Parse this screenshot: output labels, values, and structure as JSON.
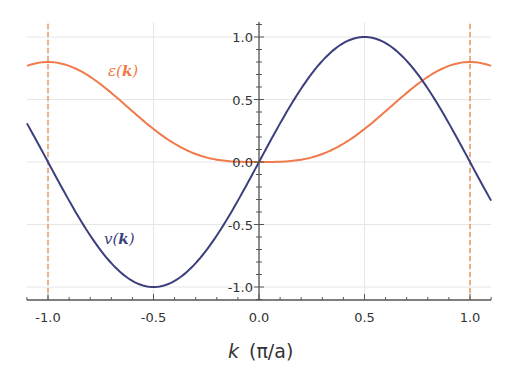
{
  "chart_data": {
    "type": "line",
    "title": "",
    "xlabel": "k  (π/a)",
    "xlabel_var": "k",
    "xlabel_unit": "(π/a)",
    "ylabel": "",
    "xlim": [
      -1.1,
      1.1
    ],
    "ylim": [
      -1.05,
      1.1
    ],
    "grid": true,
    "legend": "inline curve labels",
    "x_ticks": [
      -1.0,
      -0.5,
      0.0,
      0.5,
      1.0
    ],
    "x_tick_labels": [
      "-1.0",
      "-0.5",
      "0.0",
      "0.5",
      "1.0"
    ],
    "y_ticks": [
      -1.0,
      -0.5,
      0.0,
      0.5,
      1.0
    ],
    "y_tick_labels": [
      "-1.0",
      "-0.5",
      "0.0",
      "0.5",
      "1.0"
    ],
    "vertical_lines": [
      {
        "x": -1.0,
        "style": "dashed",
        "color": "#e8935a"
      },
      {
        "x": 1.0,
        "style": "dashed",
        "color": "#e8935a"
      }
    ],
    "series": [
      {
        "name": "ε(k)",
        "label_text": "ε(",
        "label_bold": "k",
        "label_close": ")",
        "color": "#f07a4a",
        "x": [
          -1.1,
          -1.0,
          -0.9,
          -0.8,
          -0.7,
          -0.6,
          -0.5,
          -0.4,
          -0.3,
          -0.2,
          -0.1,
          0.0,
          0.1,
          0.2,
          0.3,
          0.4,
          0.5,
          0.6,
          0.7,
          0.8,
          0.9,
          1.0,
          1.1
        ],
        "values": [
          0.73,
          0.8,
          0.77,
          0.68,
          0.55,
          0.41,
          0.26,
          0.15,
          0.07,
          0.02,
          0.004,
          0.0,
          0.004,
          0.02,
          0.07,
          0.15,
          0.26,
          0.41,
          0.55,
          0.68,
          0.77,
          0.8,
          0.73
        ]
      },
      {
        "name": "v(k)",
        "label_text": "v(",
        "label_bold": "k",
        "label_close": ")",
        "color": "#3c3f7e",
        "x": [
          -1.1,
          -1.0,
          -0.9,
          -0.8,
          -0.7,
          -0.6,
          -0.5,
          -0.4,
          -0.3,
          -0.2,
          -0.1,
          0.0,
          0.1,
          0.2,
          0.3,
          0.4,
          0.5,
          0.6,
          0.7,
          0.8,
          0.9,
          1.0,
          1.1
        ],
        "values": [
          0.31,
          0.0,
          -0.31,
          -0.59,
          -0.81,
          -0.95,
          -1.0,
          -0.95,
          -0.81,
          -0.59,
          -0.31,
          0.0,
          0.31,
          0.59,
          0.81,
          0.95,
          1.0,
          0.95,
          0.81,
          0.59,
          0.31,
          0.0,
          -0.31
        ]
      }
    ],
    "annotations": [
      {
        "text": "ε(k)",
        "x": -0.62,
        "y": 0.73
      },
      {
        "text": "v(k)",
        "x": -0.52,
        "y": -0.6
      }
    ]
  }
}
